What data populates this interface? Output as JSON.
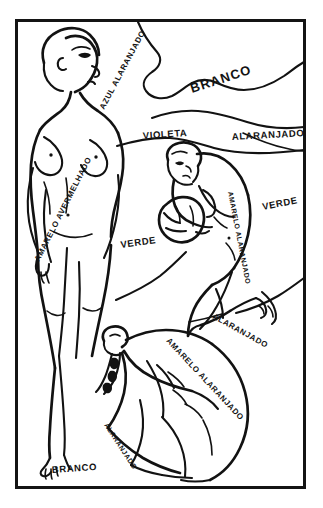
{
  "artwork": {
    "title": "Estudo de figuras com anotações de cores",
    "medium": "line-drawing",
    "frame_color": "#141414",
    "ink_color": "#121212",
    "background_color": "#ffffff"
  },
  "labels": {
    "azul_alaranjado": "AZUL ALARANJADO",
    "branco_top": "BRANCO",
    "violeta": "VIOLETA",
    "alaranjado_top": "ALARANJADO",
    "amarelo_avermelhado": "AMARELO AVERMELHADO",
    "verde_left": "VERDE",
    "verde_right": "VERDE",
    "amarelo_alaranjado_mid": "AMARELO ALARANJADO",
    "alaranjado_mid": "ALARANJADO",
    "amarelo_alaranjado_low": "AMARELO ALARANJADO",
    "alaranjado_low": "ALARANJADO",
    "branco_bottom": "BRANCO"
  },
  "figures": {
    "standing": "standing-nude-figure",
    "crouching": "crouching-figure-with-vessel",
    "bending": "bending-figure"
  }
}
